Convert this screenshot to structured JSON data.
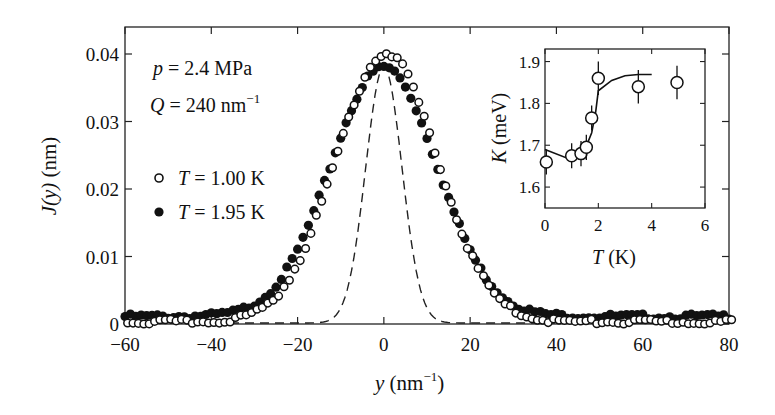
{
  "chart_data": [
    {
      "id": "main",
      "type": "scatter",
      "title": "",
      "xlabel": "y (nm⁻¹)",
      "ylabel": "J(y) (nm)",
      "xlim": [
        -60,
        80
      ],
      "ylim": [
        0,
        0.044
      ],
      "xticks": [
        -60,
        -40,
        -20,
        0,
        20,
        40,
        60,
        80
      ],
      "xtick_labels": [
        "−60",
        "−40",
        "−20",
        "0",
        "20",
        "40",
        "60",
        "80"
      ],
      "yticks": [
        0,
        0.01,
        0.02,
        0.03,
        0.04
      ],
      "ytick_labels": [
        "0",
        "0.01",
        "0.02",
        "0.03",
        "0.04"
      ],
      "grid": false,
      "annotations": [
        "p = 2.4 MPa",
        "Q = 240 nm⁻¹"
      ],
      "legend": {
        "position": "upper-left",
        "entries": [
          "T = 1.00 K",
          "T = 1.95 K"
        ]
      },
      "series": [
        {
          "name": "T = 1.00 K",
          "marker": "open-circle",
          "model": {
            "shape": "gaussian",
            "amplitude": 0.0398,
            "center": 0.0,
            "sigma": 11.8,
            "baseline": 0.0003
          },
          "x": [
            -60,
            -50,
            -40,
            -35,
            -30,
            -25,
            -20,
            -15,
            -10,
            -5,
            0,
            5,
            10,
            15,
            20,
            25,
            30,
            35,
            40,
            50,
            60,
            70,
            80
          ],
          "y": [
            0.0003,
            0.0003,
            0.0005,
            0.0012,
            0.0027,
            0.0066,
            0.0095,
            0.0178,
            0.028,
            0.0362,
            0.0398,
            0.0362,
            0.028,
            0.0178,
            0.0095,
            0.0047,
            0.002,
            0.0009,
            0.0005,
            0.0004,
            0.0004,
            0.0004,
            0.0004
          ]
        },
        {
          "name": "T = 1.95 K",
          "marker": "filled-circle",
          "model": {
            "shape": "gaussian",
            "amplitude": 0.037,
            "center": 0.0,
            "sigma": 12.3,
            "baseline": 0.0011
          },
          "x": [
            -60,
            -50,
            -40,
            -35,
            -30,
            -25,
            -20,
            -15,
            -10,
            -5,
            0,
            5,
            10,
            15,
            20,
            25,
            30,
            35,
            40,
            50,
            60,
            70,
            80
          ],
          "y": [
            0.001,
            0.0011,
            0.0016,
            0.0025,
            0.004,
            0.0074,
            0.0105,
            0.0183,
            0.028,
            0.0352,
            0.0381,
            0.0352,
            0.028,
            0.0183,
            0.0105,
            0.0058,
            0.0032,
            0.0018,
            0.0013,
            0.0011,
            0.0011,
            0.0011,
            0.0011
          ]
        },
        {
          "name": "resolution",
          "line": "dashed",
          "model": {
            "shape": "gaussian",
            "amplitude": 0.038,
            "center": 0.0,
            "sigma": 4.2,
            "baseline": 0.0
          }
        }
      ]
    },
    {
      "id": "inset",
      "type": "scatter",
      "xlabel": "T (K)",
      "ylabel": "K (meV)",
      "xlim": [
        0,
        6
      ],
      "ylim": [
        1.55,
        1.93
      ],
      "xticks": [
        0,
        2,
        4,
        6
      ],
      "xtick_labels": [
        "0",
        "2",
        "4",
        "6"
      ],
      "yticks": [
        1.6,
        1.7,
        1.8,
        1.9
      ],
      "ytick_labels": [
        "1.6",
        "1.7",
        "1.8",
        "1.9"
      ],
      "grid": false,
      "series": [
        {
          "name": "K(T)",
          "marker": "open-circle",
          "x": [
            0.05,
            1.0,
            1.35,
            1.55,
            1.75,
            2.0,
            3.5,
            4.95
          ],
          "y": [
            1.66,
            1.675,
            1.68,
            1.695,
            1.765,
            1.86,
            1.84,
            1.85
          ],
          "yerr": [
            0.03,
            0.03,
            0.03,
            0.03,
            0.03,
            0.04,
            0.04,
            0.04
          ]
        },
        {
          "name": "fit",
          "line": "solid",
          "x": [
            0,
            1.0,
            1.5,
            1.75,
            1.9,
            2.0,
            2.5,
            3.0,
            3.5,
            4.0
          ],
          "y": [
            1.69,
            1.665,
            1.69,
            1.73,
            1.78,
            1.83,
            1.855,
            1.866,
            1.869,
            1.869
          ]
        }
      ]
    }
  ],
  "labels": {
    "annotation_p_var": "p",
    "annotation_p_val": " = 2.4 MPa",
    "annotation_q_var": "Q",
    "annotation_q_val": " = 240 nm",
    "annotation_q_exp": "−1",
    "legend_1_var": "T",
    "legend_1_val": " = 1.00 K",
    "legend_2_var": "T",
    "legend_2_val": " = 1.95 K",
    "xlabel_var": "y",
    "xlabel_unit": " (nm",
    "xlabel_exp": "−1",
    "xlabel_close": ")",
    "ylabel_var": "J(y)",
    "ylabel_unit": " (nm)",
    "inset_xlabel_var": "T",
    "inset_xlabel_unit": " (K)",
    "inset_ylabel_var": "K",
    "inset_ylabel_unit": " (meV)"
  }
}
